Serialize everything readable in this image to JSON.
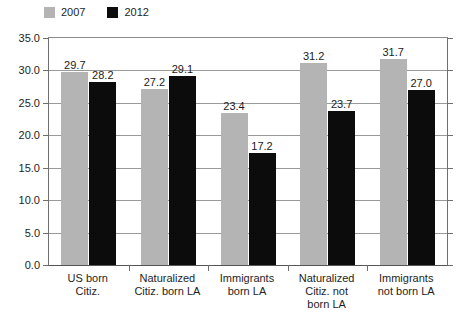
{
  "chart_data": {
    "type": "bar",
    "title": "",
    "subtitle": "",
    "xlabel": "",
    "ylabel": "",
    "ylim": [
      0.0,
      35.0
    ],
    "ytick_labels": [
      "35.0",
      "30.0",
      "25.0",
      "20.0",
      "15.0",
      "10.0",
      "5.0",
      "0.0"
    ],
    "ytick_values": [
      35.0,
      30.0,
      25.0,
      20.0,
      15.0,
      10.0,
      5.0,
      0.0
    ],
    "grid": true,
    "legend_position": "top-left",
    "categories": [
      "US born Citiz.",
      "Naturalized Citiz. born LA",
      "Immigrants born LA",
      "Naturalized Citiz. not born LA",
      "Immigrants not born LA"
    ],
    "category_lines": [
      [
        "US born",
        "Citiz."
      ],
      [
        "Naturalized",
        "Citiz. born LA"
      ],
      [
        "Immigrants",
        "born LA"
      ],
      [
        "Naturalized",
        "Citiz. not",
        "born LA"
      ],
      [
        "Immigrants",
        "not born LA"
      ]
    ],
    "series": [
      {
        "name": "2007",
        "color": "#b4b4b4",
        "values": [
          29.7,
          27.2,
          23.4,
          31.2,
          31.7
        ],
        "labels": [
          "29.7",
          "27.2",
          "23.4",
          "31.2",
          "31.7"
        ]
      },
      {
        "name": "2012",
        "color": "#0c0c0c",
        "values": [
          28.2,
          29.1,
          17.2,
          23.7,
          27.0
        ],
        "labels": [
          "28.2",
          "29.1",
          "17.2",
          "23.7",
          "27.0"
        ]
      }
    ]
  },
  "legend": {
    "entries": [
      {
        "label": "2007",
        "color": "#b4b4b4"
      },
      {
        "label": "2012",
        "color": "#0c0c0c"
      }
    ]
  },
  "colors": {
    "series_2007": "#b4b4b4",
    "series_2012": "#0c0c0c",
    "grid": "#9a9a9a",
    "axis": "#6f6f6f",
    "text": "#1e1e1e",
    "background": "#ffffff"
  }
}
